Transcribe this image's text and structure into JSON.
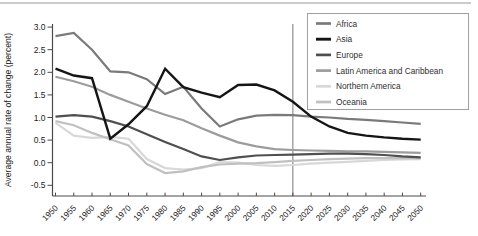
{
  "chart_data": {
    "type": "line",
    "title": "",
    "xlabel": "",
    "ylabel": "Average annual rate of change (percent)",
    "xlim": [
      1950,
      2050
    ],
    "ylim": [
      -0.5,
      3.0
    ],
    "grid": false,
    "legend_position": "top-right",
    "reference_line_x": 2015,
    "x": [
      1950,
      1955,
      1960,
      1965,
      1970,
      1975,
      1980,
      1985,
      1990,
      1995,
      2000,
      2005,
      2010,
      2015,
      2020,
      2025,
      2030,
      2035,
      2040,
      2045,
      2050
    ],
    "xtick_labels": [
      "1950",
      "1955",
      "1960",
      "1965",
      "1970",
      "1975",
      "1980",
      "1985",
      "1990",
      "1995",
      "2000",
      "2005",
      "2010",
      "2015",
      "2020",
      "2025",
      "2030",
      "2035",
      "2040",
      "2045",
      "2050"
    ],
    "ytick_values": [
      3.0,
      2.5,
      2.0,
      1.5,
      1.0,
      0.5,
      0.0,
      -0.5
    ],
    "ytick_labels": [
      "3.0",
      "2.5",
      "2.0",
      "1.5",
      "1.0",
      "0.5",
      "0.0",
      "-0.5"
    ],
    "series": [
      {
        "name": "Africa",
        "color": "#7a7a7a",
        "width": 2.2,
        "values": [
          2.8,
          2.87,
          2.5,
          2.02,
          2.0,
          1.85,
          1.52,
          1.68,
          1.2,
          0.8,
          0.96,
          1.04,
          1.06,
          1.05,
          1.02,
          1.0,
          0.97,
          0.95,
          0.92,
          0.89,
          0.86
        ]
      },
      {
        "name": "Asia",
        "color": "#151515",
        "width": 2.4,
        "values": [
          2.08,
          1.93,
          1.87,
          0.53,
          0.85,
          1.25,
          2.08,
          1.67,
          1.55,
          1.45,
          1.72,
          1.73,
          1.6,
          1.35,
          1.02,
          0.8,
          0.66,
          0.6,
          0.56,
          0.53,
          0.51
        ]
      },
      {
        "name": "Europe",
        "color": "#4f4f4f",
        "width": 2.2,
        "values": [
          1.02,
          1.05,
          1.02,
          0.92,
          0.8,
          0.63,
          0.46,
          0.3,
          0.14,
          0.06,
          0.12,
          0.16,
          0.17,
          0.18,
          0.19,
          0.2,
          0.2,
          0.19,
          0.17,
          0.14,
          0.12
        ]
      },
      {
        "name": "Latin America and Caribbean",
        "color": "#9c9c9c",
        "width": 2.2,
        "values": [
          1.9,
          1.8,
          1.68,
          1.5,
          1.35,
          1.2,
          1.06,
          0.94,
          0.76,
          0.6,
          0.45,
          0.36,
          0.3,
          0.28,
          0.27,
          0.26,
          0.25,
          0.25,
          0.24,
          0.23,
          0.22
        ]
      },
      {
        "name": "Northern America",
        "color": "#d8d8d8",
        "width": 2.2,
        "values": [
          0.88,
          0.6,
          0.55,
          0.57,
          0.53,
          0.08,
          -0.12,
          -0.15,
          -0.12,
          0.01,
          0.0,
          -0.05,
          -0.07,
          -0.05,
          -0.02,
          0.0,
          0.02,
          0.04,
          0.06,
          0.07,
          0.08
        ]
      },
      {
        "name": "Oceania",
        "color": "#c0c0c0",
        "width": 2.2,
        "values": [
          0.92,
          0.83,
          0.66,
          0.52,
          0.38,
          -0.03,
          -0.23,
          -0.19,
          -0.1,
          -0.04,
          -0.02,
          -0.01,
          0.01,
          0.04,
          0.06,
          0.08,
          0.09,
          0.1,
          0.1,
          0.1,
          0.1
        ]
      }
    ],
    "colors": {
      "background": "#ffffff",
      "axis": "#4a4a4a",
      "text": "#222222",
      "reference_line": "#777777",
      "legend_border": "#a0a0a0",
      "legend_background": "#ffffff",
      "top_rule": "#9a9a9a"
    }
  }
}
